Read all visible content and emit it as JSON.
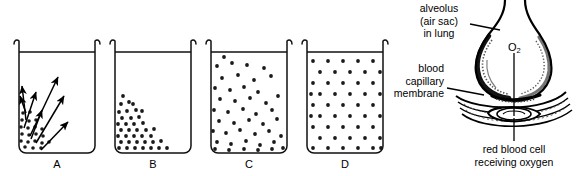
{
  "figure": {
    "type": "science-diagram",
    "topic": "diffusion and gas exchange in the lung",
    "background_color": "#ffffff",
    "ink_color": "#000000"
  },
  "beakers": {
    "dot_color": "#1a1a1a",
    "outline_color": "#111111",
    "items": [
      {
        "id": "A",
        "label": "A",
        "description": "concentrated clump of particles in lower-left with arrows radiating outward",
        "stage": "start of diffusion",
        "dot_count": 21,
        "arrow_count": 7
      },
      {
        "id": "B",
        "label": "B",
        "description": "particles spreading as a triangular gradient from the bottom-left corner",
        "stage": "early diffusion",
        "dot_count": 38,
        "arrow_count": 0
      },
      {
        "id": "C",
        "label": "C",
        "description": "particles scattered through the liquid, still slightly denser at left",
        "stage": "late diffusion",
        "dot_count": 44,
        "arrow_count": 0
      },
      {
        "id": "D",
        "label": "D",
        "description": "particles evenly spaced in a uniform lattice, equilibrium reached",
        "stage": "equilibrium",
        "dot_count": 48,
        "arrow_count": 0
      }
    ]
  },
  "alveolus": {
    "labels": {
      "alveolus": [
        "alveolus",
        "(air sac)",
        "in lung"
      ],
      "membrane": [
        "blood",
        "capillary",
        "membrane"
      ],
      "red_cell": [
        "red blood cell",
        "receiving oxygen"
      ],
      "gas": "O",
      "gas_subscript": "2"
    }
  }
}
